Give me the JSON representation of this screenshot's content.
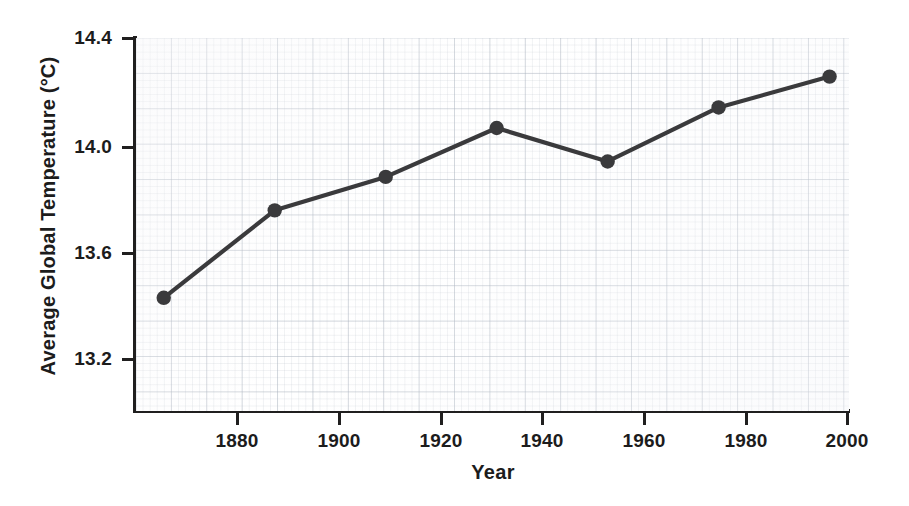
{
  "chart_data": {
    "type": "line",
    "title": "",
    "xlabel": "Year",
    "ylabel": "Average Global Temperature (°C)",
    "x": [
      1880,
      1900,
      1920,
      1940,
      1960,
      1980,
      2000
    ],
    "values": [
      13.44,
      13.78,
      13.91,
      14.1,
      13.97,
      14.18,
      14.3
    ],
    "series": [
      {
        "name": "Average Global Temperature",
        "values": [
          13.44,
          13.78,
          13.91,
          14.1,
          13.97,
          14.18,
          14.3
        ]
      }
    ],
    "xtick_labels": [
      "1880",
      "1900",
      "1920",
      "1940",
      "1960",
      "1980",
      "2000"
    ],
    "ytick_labels": [
      "14.4",
      "14.0",
      "13.6",
      "13.2"
    ],
    "ytick_values": [
      14.4,
      14.0,
      13.6,
      13.2
    ],
    "xlim": [
      1875.0,
      2003.5
    ],
    "ylim": [
      13.0,
      14.45
    ],
    "grid": true,
    "grid_style": "graph-paper",
    "legend": "none",
    "marker": "circle",
    "line_color": "#3a3a3c",
    "marker_color": "#3a3a3c",
    "axis_color": "#201f1f",
    "background_color": "#ffffff"
  }
}
